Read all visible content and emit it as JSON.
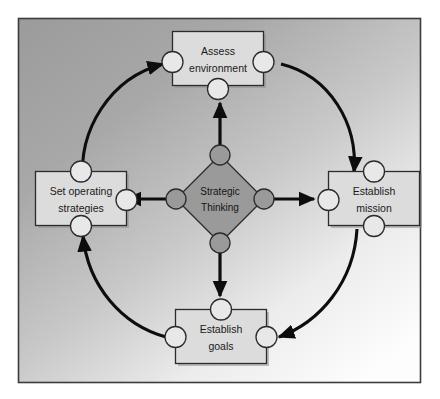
{
  "diagram": {
    "frame": {
      "border_color": "#3c3c3c",
      "background_gradient_from": "#9d9d9d",
      "background_gradient_to": "#fcfcfc"
    },
    "style": {
      "box_fill": "#dcdcdc",
      "box_border": "#2b2b2b",
      "box_shadow": "#8c8c8c",
      "diamond_fill": "#9a9a9a",
      "diamond_border": "#2b2b2b",
      "connector_white_fill": "#e8e8e8",
      "connector_gray_fill": "#9a9a9a",
      "connector_border": "#2b2b2b",
      "arrow_color": "#0d0d0d",
      "text_color": "#1a1a1a"
    },
    "center": {
      "name": "strategic-thinking",
      "label_line1": "Strategic",
      "label_line2": "Thinking"
    },
    "nodes": [
      {
        "id": "assess-environment",
        "label_line1": "Assess",
        "label_line2": "environment",
        "position": "top"
      },
      {
        "id": "establish-mission",
        "label_line1": "Establish",
        "label_line2": "mission",
        "position": "right"
      },
      {
        "id": "establish-goals",
        "label_line1": "Establish",
        "label_line2": "goals",
        "position": "bottom"
      },
      {
        "id": "set-operating-strategies",
        "label_line1": "Set operating",
        "label_line2": "strategies",
        "position": "left"
      }
    ],
    "cycle_arrows": [
      {
        "from": "assess-environment",
        "to": "establish-mission",
        "shape": "curved-clockwise"
      },
      {
        "from": "establish-mission",
        "to": "establish-goals",
        "shape": "curved-clockwise"
      },
      {
        "from": "establish-goals",
        "to": "set-operating-strategies",
        "shape": "curved-clockwise"
      },
      {
        "from": "set-operating-strategies",
        "to": "assess-environment",
        "shape": "curved-clockwise"
      }
    ],
    "radial_arrows": [
      {
        "from": "strategic-thinking",
        "to": "assess-environment",
        "direction": "up"
      },
      {
        "from": "strategic-thinking",
        "to": "establish-mission",
        "direction": "right"
      },
      {
        "from": "strategic-thinking",
        "to": "establish-goals",
        "direction": "down"
      },
      {
        "from": "strategic-thinking",
        "to": "set-operating-strategies",
        "direction": "left"
      }
    ]
  }
}
